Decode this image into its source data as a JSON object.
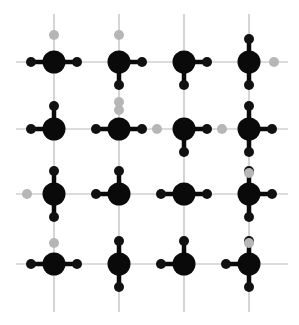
{
  "figure": {
    "title": "",
    "type": "lattice-diagram",
    "width": 299,
    "height": 325,
    "background": "#ffffff"
  },
  "chart_data": {
    "type": "scatter",
    "title": "",
    "xlabel": "",
    "ylabel": "",
    "grid": true,
    "legend": "none",
    "xlim": [
      0,
      299
    ],
    "ylim": [
      0,
      325
    ],
    "colors": {
      "node": "#0a0a0a",
      "bond": "#0a0a0a",
      "satellite_active": "#111111",
      "satellite_inactive": "#b6b6b6",
      "lattice_line": "#b9b9b9",
      "background": "#ffffff"
    },
    "geometry": {
      "columns_x": [
        54,
        119,
        184,
        249
      ],
      "rows_y": [
        62,
        129,
        194,
        264
      ],
      "node_radius": 11.5,
      "satellite_radius": 5.0,
      "bond_width": 4.5,
      "lattice_line_width": 1.2,
      "stub_length": 23,
      "lattice_x_extent": [
        16,
        288
      ],
      "lattice_y_extent": [
        14,
        312
      ]
    },
    "nodes": [
      {
        "id": "n11",
        "row": 0,
        "col": 0,
        "x": 54,
        "y": 62,
        "r": 11.5
      },
      {
        "id": "n12",
        "row": 0,
        "col": 1,
        "x": 119,
        "y": 62,
        "r": 11.5
      },
      {
        "id": "n13",
        "row": 0,
        "col": 2,
        "x": 184,
        "y": 62,
        "r": 11.5
      },
      {
        "id": "n14",
        "row": 0,
        "col": 3,
        "x": 249,
        "y": 62,
        "r": 11.5
      },
      {
        "id": "n21",
        "row": 1,
        "col": 0,
        "x": 54,
        "y": 129,
        "r": 11.5
      },
      {
        "id": "n22",
        "row": 1,
        "col": 1,
        "x": 119,
        "y": 129,
        "r": 11.5
      },
      {
        "id": "n23",
        "row": 1,
        "col": 2,
        "x": 184,
        "y": 129,
        "r": 11.5
      },
      {
        "id": "n24",
        "row": 1,
        "col": 3,
        "x": 249,
        "y": 129,
        "r": 11.5
      },
      {
        "id": "n31",
        "row": 2,
        "col": 0,
        "x": 54,
        "y": 194,
        "r": 11.5
      },
      {
        "id": "n32",
        "row": 2,
        "col": 1,
        "x": 119,
        "y": 194,
        "r": 11.5
      },
      {
        "id": "n33",
        "row": 2,
        "col": 2,
        "x": 184,
        "y": 194,
        "r": 11.5
      },
      {
        "id": "n34",
        "row": 2,
        "col": 3,
        "x": 249,
        "y": 194,
        "r": 11.5
      },
      {
        "id": "n41",
        "row": 3,
        "col": 0,
        "x": 54,
        "y": 264,
        "r": 11.5
      },
      {
        "id": "n42",
        "row": 3,
        "col": 1,
        "x": 119,
        "y": 264,
        "r": 11.5
      },
      {
        "id": "n43",
        "row": 3,
        "col": 2,
        "x": 184,
        "y": 264,
        "r": 11.5
      },
      {
        "id": "n44",
        "row": 3,
        "col": 3,
        "x": 249,
        "y": 264,
        "r": 11.5
      }
    ],
    "lattice_lines": {
      "horizontal_y": [
        62,
        129,
        194,
        264
      ],
      "horizontal_span": [
        16,
        288
      ],
      "vertical_x": [
        54,
        119,
        184,
        249
      ],
      "vertical_span": [
        14,
        312
      ]
    },
    "bonds": [
      {
        "from": "n11",
        "dir": "left",
        "length": 23,
        "satellite": "active"
      },
      {
        "from": "n11",
        "dir": "right",
        "length": 23,
        "satellite": "active"
      },
      {
        "from": "n11",
        "dir": "up",
        "length": 27,
        "satellite": "inactive"
      },
      {
        "from": "n12",
        "dir": "right",
        "length": 23,
        "satellite": "active"
      },
      {
        "from": "n12",
        "dir": "down",
        "length": 23,
        "satellite": "active"
      },
      {
        "from": "n12",
        "dir": "up",
        "length": 27,
        "satellite": "inactive"
      },
      {
        "from": "n13",
        "dir": "right",
        "length": 23,
        "satellite": "active"
      },
      {
        "from": "n13",
        "dir": "down",
        "length": 23,
        "satellite": "active"
      },
      {
        "from": "n14",
        "dir": "up",
        "length": 23,
        "satellite": "active"
      },
      {
        "from": "n14",
        "dir": "down",
        "length": 23,
        "satellite": "active"
      },
      {
        "from": "n14",
        "dir": "right",
        "length": 25,
        "satellite": "inactive"
      },
      {
        "from": "n21",
        "dir": "left",
        "length": 23,
        "satellite": "active"
      },
      {
        "from": "n21",
        "dir": "up",
        "length": 23,
        "satellite": "active"
      },
      {
        "from": "n22",
        "dir": "left",
        "length": 23,
        "satellite": "active"
      },
      {
        "from": "n22",
        "dir": "right",
        "length": 23,
        "satellite": "active"
      },
      {
        "from": "n22",
        "dir": "up",
        "length": 27,
        "satellite": "inactive"
      },
      {
        "from": "n23",
        "dir": "right",
        "length": 23,
        "satellite": "active"
      },
      {
        "from": "n23",
        "dir": "down",
        "length": 23,
        "satellite": "active"
      },
      {
        "from": "n23",
        "dir": "left",
        "length": 27,
        "satellite": "inactive"
      },
      {
        "from": "n24",
        "dir": "left",
        "length": 27,
        "satellite": "inactive"
      },
      {
        "from": "n24",
        "dir": "right",
        "length": 23,
        "satellite": "active"
      },
      {
        "from": "n24",
        "dir": "up",
        "length": 23,
        "satellite": "active"
      },
      {
        "from": "n24",
        "dir": "down",
        "length": 23,
        "satellite": "active"
      },
      {
        "from": "n31",
        "dir": "up",
        "length": 23,
        "satellite": "active"
      },
      {
        "from": "n31",
        "dir": "down",
        "length": 23,
        "satellite": "active"
      },
      {
        "from": "n31",
        "dir": "left",
        "length": 27,
        "satellite": "inactive"
      },
      {
        "from": "n32",
        "dir": "left",
        "length": 23,
        "satellite": "active"
      },
      {
        "from": "n32",
        "dir": "up",
        "length": 23,
        "satellite": "active"
      },
      {
        "from": "n33",
        "dir": "left",
        "length": 23,
        "satellite": "active"
      },
      {
        "from": "n33",
        "dir": "right",
        "length": 23,
        "satellite": "active"
      },
      {
        "from": "n34",
        "dir": "right",
        "length": 23,
        "satellite": "active"
      },
      {
        "from": "n34",
        "dir": "up",
        "length": 23,
        "satellite": "active"
      },
      {
        "from": "n34",
        "dir": "down",
        "length": 23,
        "satellite": "active"
      },
      {
        "from": "n41",
        "dir": "left",
        "length": 23,
        "satellite": "active"
      },
      {
        "from": "n41",
        "dir": "right",
        "length": 23,
        "satellite": "active"
      },
      {
        "from": "n42",
        "dir": "up",
        "length": 23,
        "satellite": "active"
      },
      {
        "from": "n42",
        "dir": "down",
        "length": 23,
        "satellite": "active"
      },
      {
        "from": "n43",
        "dir": "left",
        "length": 23,
        "satellite": "active"
      },
      {
        "from": "n43",
        "dir": "up",
        "length": 23,
        "satellite": "active"
      },
      {
        "from": "n44",
        "dir": "left",
        "length": 23,
        "satellite": "active"
      },
      {
        "from": "n44",
        "dir": "up",
        "length": 23,
        "satellite": "active"
      },
      {
        "from": "n44",
        "dir": "down",
        "length": 23,
        "satellite": "active"
      }
    ],
    "loose_satellites": [
      {
        "x": 54,
        "y": 243,
        "state": "inactive"
      },
      {
        "x": 119,
        "y": 110,
        "state": "inactive"
      },
      {
        "x": 249,
        "y": 173,
        "state": "inactive"
      },
      {
        "x": 249,
        "y": 243,
        "state": "inactive"
      }
    ]
  }
}
